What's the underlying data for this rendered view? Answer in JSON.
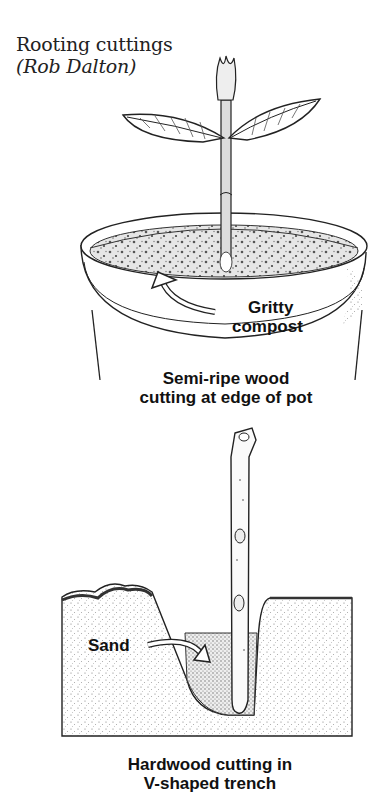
{
  "figure": {
    "title": "Rooting cuttings",
    "credit": "(Rob Dalton)"
  },
  "top_illustration": {
    "arrow_label_line1": "Gritty",
    "arrow_label_line2": "compost",
    "caption_line1": "Semi-ripe wood",
    "caption_line2": "cutting at edge of pot"
  },
  "bottom_illustration": {
    "arrow_label": "Sand",
    "caption_line1": "Hardwood cutting in",
    "caption_line2": "V-shaped trench"
  },
  "colors": {
    "ink": "#111111",
    "paper": "#ffffff",
    "stipple": "#888888"
  }
}
